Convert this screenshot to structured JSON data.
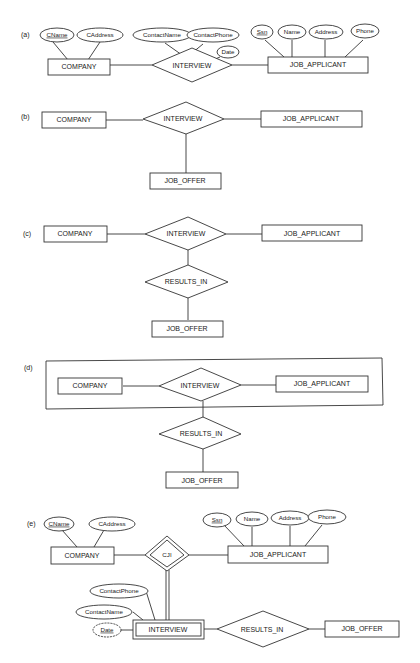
{
  "diagrams": {
    "a": {
      "label": "(a)",
      "entities": {
        "company": "COMPANY",
        "job_applicant": "JOB_APPLICANT"
      },
      "relationship": "INTERVIEW",
      "company_attrs": [
        "CName",
        "CAddress"
      ],
      "interview_attrs": [
        "ContactName",
        "ContactPhone",
        "Date"
      ],
      "applicant_attrs": [
        "Ssn",
        "Name",
        "Address",
        "Phone"
      ]
    },
    "b": {
      "label": "(b)",
      "entities": {
        "company": "COMPANY",
        "job_applicant": "JOB_APPLICANT",
        "job_offer": "JOB_OFFER"
      },
      "relationship": "INTERVIEW"
    },
    "c": {
      "label": "(c)",
      "entities": {
        "company": "COMPANY",
        "job_applicant": "JOB_APPLICANT",
        "job_offer": "JOB_OFFER"
      },
      "relationships": {
        "interview": "INTERVIEW",
        "results_in": "RESULTS_IN"
      }
    },
    "d": {
      "label": "(d)",
      "entities": {
        "company": "COMPANY",
        "job_applicant": "JOB_APPLICANT",
        "job_offer": "JOB_OFFER"
      },
      "relationships": {
        "interview": "INTERVIEW",
        "results_in": "RESULTS_IN"
      }
    },
    "e": {
      "label": "(e)",
      "entities": {
        "company": "COMPANY",
        "job_applicant": "JOB_APPLICANT",
        "job_offer": "JOB_OFFER"
      },
      "weak_entity": "INTERVIEW",
      "identifying_relationship": "CJI",
      "relationship": "RESULTS_IN",
      "company_attrs": [
        "CName",
        "CAddress"
      ],
      "applicant_attrs": [
        "Ssn",
        "Name",
        "Address",
        "Phone"
      ],
      "interview_attrs": [
        "ContactPhone",
        "ContactName",
        "Date"
      ]
    }
  }
}
